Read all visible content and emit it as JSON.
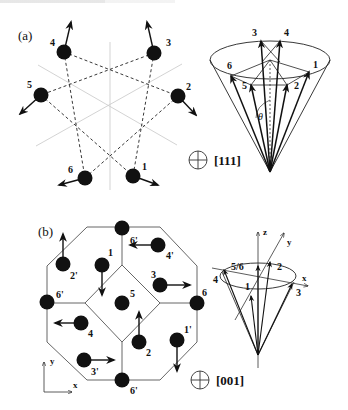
{
  "figure": {
    "panel_a": {
      "label": "(a)",
      "direction_label": "[111]",
      "direction_icon": "crossed-circle-icon",
      "atoms": [
        {
          "id": "1",
          "x": 133,
          "y": 176,
          "lx": 142,
          "ly": 170,
          "ax": 158,
          "ay": 185
        },
        {
          "id": "2",
          "x": 178,
          "y": 96,
          "lx": 186,
          "ly": 90,
          "ax": 196,
          "ay": 115
        },
        {
          "id": "3",
          "x": 154,
          "y": 53,
          "lx": 166,
          "ly": 46,
          "ax": 147,
          "ay": 22
        },
        {
          "id": "4",
          "x": 64,
          "y": 52,
          "lx": 50,
          "ly": 46,
          "ax": 71,
          "ay": 22
        },
        {
          "id": "5",
          "x": 41,
          "y": 95,
          "lx": 27,
          "ly": 88,
          "ax": 20,
          "ay": 114
        },
        {
          "id": "6",
          "x": 85,
          "y": 178,
          "lx": 68,
          "ly": 173,
          "ax": 59,
          "ay": 185
        }
      ],
      "cone": {
        "apex": [
          270,
          172
        ],
        "ellipse": {
          "cx": 270,
          "cy": 60,
          "rx": 60,
          "ry": 19
        },
        "theta_label": "θ",
        "vectors": [
          {
            "id": "1",
            "x": 309,
            "y": 72,
            "lx": 313,
            "ly": 68
          },
          {
            "id": "2",
            "x": 287,
            "y": 85,
            "lx": 294,
            "ly": 89
          },
          {
            "id": "3",
            "x": 261,
            "y": 41,
            "lx": 252,
            "ly": 36
          },
          {
            "id": "4",
            "x": 280,
            "y": 41,
            "lx": 284,
            "ly": 36
          },
          {
            "id": "5",
            "x": 251,
            "y": 85,
            "lx": 242,
            "ly": 89
          },
          {
            "id": "6",
            "x": 231,
            "y": 76,
            "lx": 227,
            "ly": 69
          }
        ]
      }
    },
    "panel_b": {
      "label": "(b)",
      "direction_label": "[001]",
      "direction_icon": "crossed-circle-icon",
      "axes": {
        "x_label": "x",
        "y_label": "y"
      },
      "atoms": [
        {
          "id": "1",
          "x": 102,
          "y": 265,
          "lx": 108,
          "ly": 256,
          "ax": 102,
          "ay": 295
        },
        {
          "id": "2",
          "x": 139,
          "y": 342,
          "lx": 146,
          "ly": 356,
          "ax": 139,
          "ay": 312
        },
        {
          "id": "3",
          "x": 160,
          "y": 285,
          "lx": 151,
          "ly": 278,
          "ax": 190,
          "ay": 285
        },
        {
          "id": "4",
          "x": 81,
          "y": 323,
          "lx": 88,
          "ly": 337,
          "ax": 55,
          "ay": 323
        },
        {
          "id": "5",
          "x": 122,
          "y": 303,
          "lx": 130,
          "ly": 297,
          "ax": null,
          "ay": null
        },
        {
          "id": "6",
          "x": 197,
          "y": 303,
          "lx": 202,
          "ly": 296,
          "ax": null,
          "ay": null
        },
        {
          "id": "1'",
          "x": 177,
          "y": 340,
          "lx": 184,
          "ly": 333,
          "ax": 177,
          "ay": 371
        },
        {
          "id": "2'",
          "x": 63,
          "y": 264,
          "lx": 70,
          "ly": 279,
          "ax": 63,
          "ay": 234
        },
        {
          "id": "3'",
          "x": 84,
          "y": 360,
          "lx": 91,
          "ly": 375,
          "ax": 114,
          "ay": 360
        },
        {
          "id": "4'",
          "x": 158,
          "y": 245,
          "lx": 166,
          "ly": 259,
          "ax": 130,
          "ay": 245
        },
        {
          "id": "6'",
          "x": 122,
          "y": 228,
          "lx": 130,
          "ly": 244,
          "ax": null,
          "ay": null
        },
        {
          "id": "6'",
          "x": 47,
          "y": 302,
          "lx": 56,
          "ly": 298,
          "ax": null,
          "ay": null
        },
        {
          "id": "6'",
          "x": 122,
          "y": 380,
          "lx": 130,
          "ly": 394,
          "ax": null,
          "ay": null
        }
      ],
      "cone": {
        "apex": [
          258,
          355
        ],
        "ellipse": {
          "cx": 258,
          "cy": 276,
          "rx": 38,
          "ry": 13
        },
        "axis_labels": {
          "x": "x",
          "y": "y",
          "z": "z"
        },
        "vectors": [
          {
            "id": "1",
            "x": 251,
            "y": 296,
            "lx": 245,
            "ly": 290
          },
          {
            "id": "2",
            "x": 270,
            "y": 262,
            "lx": 277,
            "ly": 270
          },
          {
            "id": "3",
            "x": 292,
            "y": 284,
            "lx": 296,
            "ly": 296
          },
          {
            "id": "4",
            "x": 224,
            "y": 270,
            "lx": 213,
            "ly": 283
          },
          {
            "id": "5/6",
            "x": 258,
            "y": 266,
            "lx": 231,
            "ly": 270
          }
        ]
      }
    }
  }
}
